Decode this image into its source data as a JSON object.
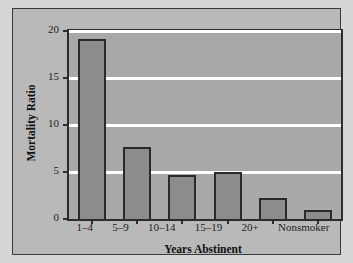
{
  "chart_data": {
    "type": "bar",
    "title": "",
    "xlabel": "Years Abstinent",
    "ylabel": "Mortality Ratio",
    "categories": [
      "1–4",
      "5–9",
      "10–14",
      "15–19",
      "20+",
      "Nonsmoker"
    ],
    "values": [
      19.1,
      7.7,
      4.7,
      5.0,
      2.2,
      1.0
    ],
    "ylim": [
      0,
      20
    ],
    "yticks": [
      0,
      5,
      10,
      15,
      20
    ],
    "ytick_labels": [
      "0",
      "5",
      "10",
      "15",
      "20"
    ],
    "gridlines": "horizontal-white-at-yticks",
    "legend": "none",
    "colors": {
      "bar_fill": "#8c8c8c",
      "bar_edge": "#2a2a2a",
      "plot_background": "#a9a9a9",
      "panel_background": "#b9b9b9",
      "figure_background": "#d6d6d6",
      "gridline": "#ffffff",
      "axis": "#2c2c2c",
      "text": "#1d1d1d"
    }
  }
}
